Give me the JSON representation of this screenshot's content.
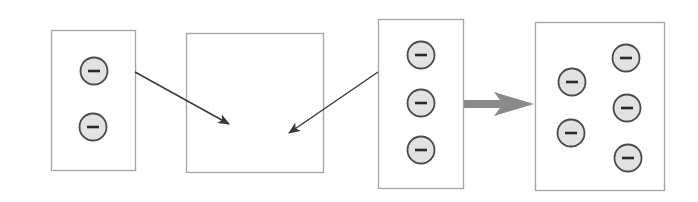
{
  "diagram": {
    "colors": {
      "box_stroke": "#a8a8a8",
      "charge_fill": "#e2e2e2",
      "charge_stroke": "#4a4a4a",
      "charge_sign": "#2a2a2a",
      "thin_arrow": "#3a3a3a",
      "thick_arrow": "#8a8a8a"
    },
    "charge_symbol": "minus",
    "boxes": [
      {
        "id": "box-1",
        "x": 51,
        "y": 30,
        "w": 84,
        "h": 140,
        "charges": [
          [
            94,
            71
          ],
          [
            93,
            127
          ]
        ]
      },
      {
        "id": "box-2",
        "x": 186,
        "y": 33,
        "w": 137,
        "h": 139,
        "charges": []
      },
      {
        "id": "box-3",
        "x": 378,
        "y": 19,
        "w": 85,
        "h": 169,
        "charges": [
          [
            421,
            55
          ],
          [
            421,
            103
          ],
          [
            421,
            150
          ]
        ]
      },
      {
        "id": "box-4",
        "x": 535,
        "y": 22,
        "w": 129,
        "h": 168,
        "charges": [
          [
            572,
            82
          ],
          [
            571,
            133
          ],
          [
            626,
            58
          ],
          [
            627,
            108
          ],
          [
            628,
            158
          ]
        ]
      }
    ],
    "arrows": [
      {
        "id": "arrow-box1-to-box2",
        "from": [
          135,
          72
        ],
        "to": [
          229,
          124
        ]
      },
      {
        "id": "arrow-box3-to-box2",
        "from": [
          378,
          72
        ],
        "to": [
          289,
          133
        ]
      }
    ],
    "result_arrow": {
      "from": [
        464,
        104
      ],
      "to": [
        534,
        104
      ]
    }
  }
}
